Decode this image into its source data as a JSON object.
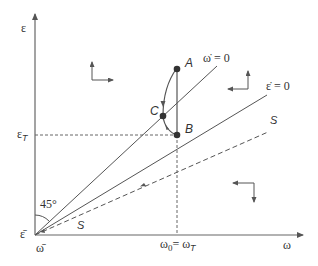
{
  "diagram": {
    "axes": {
      "y_label": "ε",
      "x_label": "ω",
      "origin_y_label": "ε̄",
      "origin_x_label": "ω̄"
    },
    "levels": {
      "epsilon_T": "ε",
      "epsilon_T_sub": "T",
      "omega_0": "ω",
      "omega_0_sub": "0",
      "omega_eq": "= ω",
      "omega_T_sub": "T"
    },
    "lines": {
      "omega_dot_zero": "ω̇ = 0",
      "epsilon_dot_zero": "ε̇ = 0",
      "saddle_path_upper": "S",
      "saddle_path_lower": "S"
    },
    "points": {
      "A": "A",
      "B": "B",
      "C": "C"
    },
    "angle_label": "45°",
    "colors": {
      "line": "#555555",
      "text": "#333333",
      "background": "#ffffff"
    }
  }
}
